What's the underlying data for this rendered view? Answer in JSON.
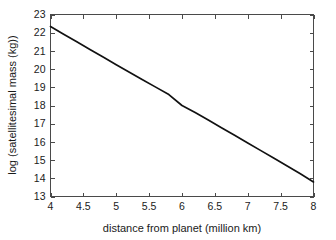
{
  "chart_data": {
    "type": "line",
    "title": "",
    "xlabel": "distance from planet (million km)",
    "ylabel": "log (satellitesimal mass (kg))",
    "xlim": [
      4,
      8
    ],
    "ylim": [
      13,
      23
    ],
    "xticks": [
      "4",
      "4.5",
      "5",
      "5.5",
      "6",
      "6.5",
      "7",
      "7.5",
      "8"
    ],
    "xtick_values": [
      4,
      4.5,
      5,
      5.5,
      6,
      6.5,
      7,
      7.5,
      8
    ],
    "yticks": [
      "13",
      "14",
      "15",
      "16",
      "17",
      "18",
      "19",
      "20",
      "21",
      "22",
      "23"
    ],
    "ytick_values": [
      13,
      14,
      15,
      16,
      17,
      18,
      19,
      20,
      21,
      22,
      23
    ],
    "grid": false,
    "legend": null,
    "line_color": "#111111",
    "background_color": "#ffffff",
    "axis_color": "#4a4a4a",
    "series": [
      {
        "name": "log satellitesimal mass",
        "x": [
          4.0,
          4.2,
          4.4,
          4.6,
          4.8,
          5.0,
          5.2,
          5.4,
          5.6,
          5.8,
          6.0,
          6.2,
          6.4,
          6.6,
          6.8,
          7.0,
          7.2,
          7.4,
          7.6,
          7.8,
          8.0
        ],
        "values": [
          22.34,
          21.92,
          21.5,
          21.08,
          20.66,
          20.24,
          19.83,
          19.42,
          19.01,
          18.6,
          18.0,
          17.62,
          17.2,
          16.78,
          16.36,
          15.94,
          15.52,
          15.1,
          14.68,
          14.25,
          13.8
        ]
      }
    ]
  },
  "figure": {
    "caption": ""
  }
}
